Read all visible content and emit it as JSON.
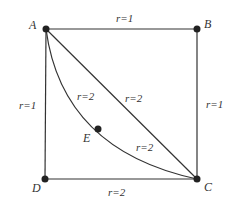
{
  "diagram": {
    "points": {
      "A": {
        "label": "A",
        "x": 46,
        "y": 29
      },
      "B": {
        "label": "B",
        "x": 197,
        "y": 29
      },
      "C": {
        "label": "C",
        "x": 197,
        "y": 179
      },
      "D": {
        "label": "D",
        "x": 45,
        "y": 179
      },
      "E": {
        "label": "E",
        "x": 98,
        "y": 129
      }
    },
    "edges": {
      "AB": "r=1",
      "BC": "r=1",
      "AD": "r=1",
      "DC": "r=2",
      "AC": "r=2",
      "AE": "r=2",
      "EC": "r=2"
    },
    "colors": {
      "line": "#333333",
      "node": "#222222",
      "background": "#ffffff"
    }
  }
}
